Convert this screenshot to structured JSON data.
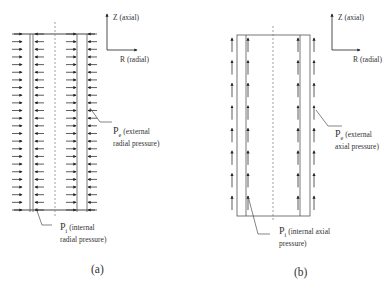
{
  "figures": [
    {
      "id": "a",
      "caption": "(a)",
      "axis": {
        "z_label": "Z (axial)",
        "r_label": "R (radial)"
      },
      "external_label": {
        "symbol": "P",
        "sub": "e",
        "line1": "(external",
        "line2": "radial pressure)"
      },
      "internal_label": {
        "symbol": "P",
        "sub": "i",
        "line1": "(internal",
        "line2": "radial pressure)"
      },
      "arrow_direction": "radial",
      "arrow_rows": 24
    },
    {
      "id": "b",
      "caption": "(b)",
      "axis": {
        "z_label": "Z (axial)",
        "r_label": "R (radial)"
      },
      "external_label": {
        "symbol": "P",
        "sub": "e",
        "line1": "(external",
        "line2": "axial pressure)"
      },
      "internal_label": {
        "symbol": "P",
        "sub": "i",
        "line1": "(internal axial",
        "line2": "pressure)"
      },
      "arrow_direction": "axial",
      "arrow_rows": 8
    }
  ]
}
